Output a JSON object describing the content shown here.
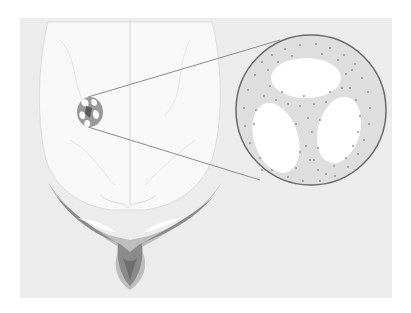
{
  "figure": {
    "elements": {
      "brain": "brain-outline",
      "lesion": "lesion-spot",
      "inset": "magnified-inset-circle",
      "base": "skull-base-structure"
    }
  },
  "colors": {
    "page_bg": "#ffffff",
    "panel_bg": "#ececec",
    "brain_fill": "#f7f7f7",
    "inset_fill": "#dcdcdc",
    "inset_stroke": "#6a6a6a",
    "dots": "#8a8a8a",
    "base_light": "#b8b8b8",
    "base_dark": "#7a7a7a"
  }
}
